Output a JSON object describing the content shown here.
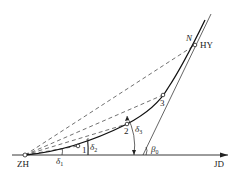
{
  "diagram": {
    "type": "spiral curve deflection angle layout",
    "colors": {
      "line": "#222222",
      "background": "#ffffff"
    },
    "labels": {
      "start_point": "ZH",
      "end_point": "HY",
      "intersection_point": "JD",
      "point_n": "N",
      "point_1": "1",
      "point_2": "2",
      "point_3": "3",
      "delta_1": "δ",
      "delta_1_sub": "1",
      "delta_2": "δ",
      "delta_2_sub": "2",
      "delta_3": "δ",
      "delta_3_sub": "3",
      "beta_0": "β",
      "beta_0_sub": "0"
    }
  }
}
